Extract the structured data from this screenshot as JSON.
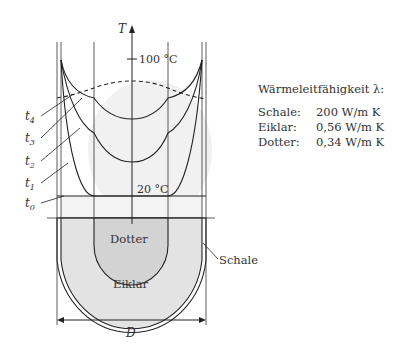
{
  "axis": {
    "label": "T",
    "tick_top": "100 °C",
    "tick_bottom": "20 °C"
  },
  "time_labels": [
    "t4",
    "t3",
    "t2",
    "t1",
    "t0"
  ],
  "regions": {
    "yolk": "Dotter",
    "white": "Eiklar",
    "shell": "Schale"
  },
  "dimension": "D",
  "legend": {
    "title": "Wärmeleitfähigkeit λ:",
    "rows": [
      {
        "material": "Schale:",
        "value": "200 W/m K"
      },
      {
        "material": "Eiklar:",
        "value": "0,56 W/m K"
      },
      {
        "material": "Dotter:",
        "value": "0,34 W/m K"
      }
    ]
  },
  "colors": {
    "line": "#222222",
    "white_fill": "#e3e3e3",
    "yolk_fill": "#d2d2d2",
    "bg_fill": "#f0f0f0"
  }
}
